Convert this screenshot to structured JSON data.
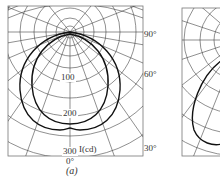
{
  "figure": {
    "panels": [
      {
        "id": "a",
        "caption": "(a)",
        "radial_labels": [
          "100",
          "200",
          "300"
        ],
        "unit_label": "I(cd)",
        "angle_labels": [
          "90°",
          "60°",
          "30°",
          "0°"
        ],
        "curves": 2
      },
      {
        "id": "b",
        "caption": "",
        "curves": 1
      }
    ]
  }
}
